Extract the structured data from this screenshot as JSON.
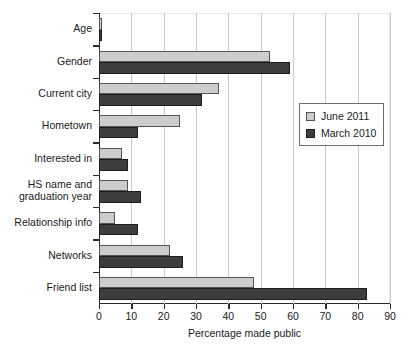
{
  "chart_data": {
    "type": "bar",
    "orientation": "horizontal",
    "title": "",
    "xlabel": "Percentage made public",
    "ylabel": "",
    "xlim": [
      0,
      90
    ],
    "xticks": [
      0,
      10,
      20,
      30,
      40,
      50,
      60,
      70,
      80,
      90
    ],
    "grid": "vertical",
    "legend_position": "right-upper",
    "categories": [
      "Age",
      "Gender",
      "Current city",
      "Hometown",
      "Interested in",
      "HS name and\ngraduation year",
      "Relationship info",
      "Networks",
      "Friend list"
    ],
    "series": [
      {
        "name": "June 2011",
        "color": "#cccccc",
        "values": [
          1,
          53,
          37,
          25,
          7,
          9,
          5,
          22,
          48
        ]
      },
      {
        "name": "March 2010",
        "color": "#3d3d3d",
        "values": [
          1,
          59,
          32,
          12,
          9,
          13,
          12,
          26,
          83
        ]
      }
    ]
  },
  "legend": {
    "entries": [
      {
        "label": "June 2011",
        "swatch": "light"
      },
      {
        "label": "March 2010",
        "swatch": "dark"
      }
    ]
  }
}
